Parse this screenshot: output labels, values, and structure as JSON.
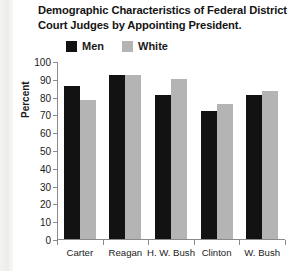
{
  "chart_data": {
    "type": "bar",
    "title": "Demographic Characteristics of Federal District Court Judges by Appointing President.",
    "xlabel": "",
    "ylabel": "Percent",
    "ylim": [
      0,
      100
    ],
    "ytick_step": 10,
    "yticks": [
      100,
      90,
      80,
      70,
      60,
      50,
      40,
      30,
      20,
      10,
      0
    ],
    "grid": false,
    "legend_position": "top",
    "categories": [
      "Carter",
      "Reagan",
      "H. W. Bush",
      "Clinton",
      "W. Bush"
    ],
    "series": [
      {
        "name": "Men",
        "color": "#121212",
        "values": [
          86,
          92,
          81,
          72,
          81
        ]
      },
      {
        "name": "White",
        "color": "#b4b4b4",
        "values": [
          78,
          92,
          90,
          76,
          83
        ]
      }
    ]
  },
  "legend": {
    "items": [
      {
        "label": "Men",
        "swatch": "black-square-icon"
      },
      {
        "label": "White",
        "swatch": "gray-square-icon"
      }
    ]
  }
}
